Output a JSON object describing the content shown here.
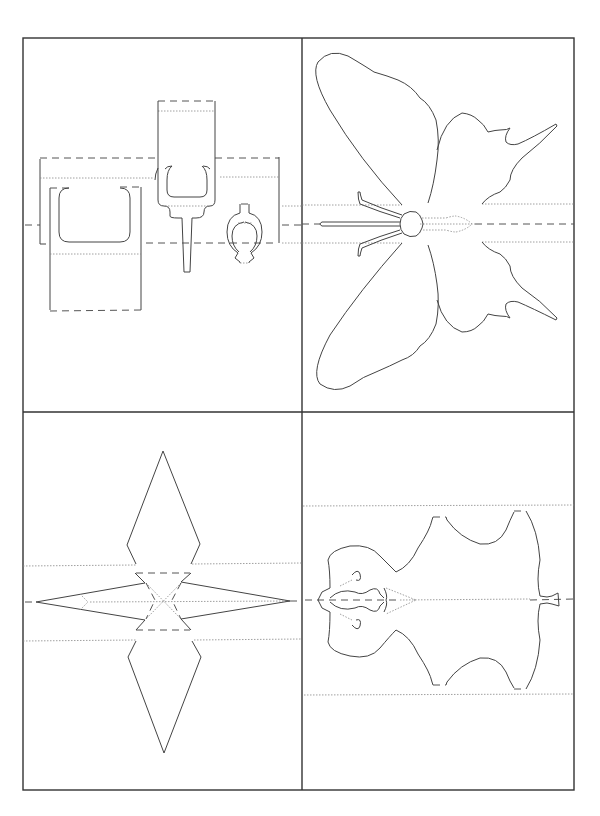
{
  "page": {
    "title": "Pop-up card templates",
    "background": "#ffffff",
    "line_color": "#333333"
  },
  "panels": [
    {
      "id": "chair-lamp-vase",
      "label": "Armchair, lamp and vase pop-up template",
      "position": "top-left"
    },
    {
      "id": "butterfly",
      "label": "Butterfly pop-up template",
      "position": "top-right"
    },
    {
      "id": "star",
      "label": "Four-point star pop-up template",
      "position": "bottom-left"
    },
    {
      "id": "animal-skin",
      "label": "Animal skin rug pop-up template",
      "position": "bottom-right"
    }
  ],
  "legend": {
    "solid": "cut line",
    "dashed": "mountain fold",
    "dotted": "valley fold"
  }
}
